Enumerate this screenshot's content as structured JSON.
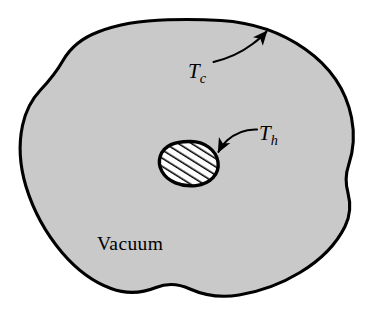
{
  "figure": {
    "name": "vacuum-enclosure-radiation-diagram",
    "background_color": "#ffffff",
    "outline_color": "#000000",
    "fill_color": "#c9c9c9",
    "enclosure": {
      "region_label": "Vacuum",
      "surface_temperature_symbol": "T",
      "surface_temperature_subscript": "c"
    },
    "inner_body": {
      "hatch_color": "#000000",
      "temperature_symbol": "T",
      "temperature_subscript": "h"
    },
    "labels": {
      "cold_surface": {
        "symbol": "T",
        "subscript": "c",
        "full": "Tc"
      },
      "hot_body": {
        "symbol": "T",
        "subscript": "h",
        "full": "Th"
      },
      "medium": "Vacuum"
    },
    "annotations": [
      {
        "name": "cold-surface-pointer",
        "label": "Tc",
        "points_to": "enclosure-boundary"
      },
      {
        "name": "hot-body-pointer",
        "label": "Th",
        "points_to": "hatched-inner-body"
      }
    ]
  }
}
